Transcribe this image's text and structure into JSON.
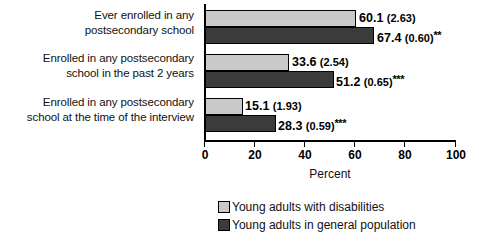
{
  "chart_data": {
    "type": "bar",
    "orientation": "horizontal",
    "title": "",
    "xlabel": "Percent",
    "ylabel": "",
    "xlim": [
      0,
      100
    ],
    "xticks": [
      0,
      20,
      40,
      60,
      80,
      100
    ],
    "grid": false,
    "legend_position": "bottom-center",
    "categories": [
      "Ever enrolled in any postsecondary school",
      "Enrolled in any postsecondary school in the past 2 years",
      "Enrolled in any postsecondary school at the time of the interview"
    ],
    "category_lines": [
      [
        "Ever enrolled in any",
        "postsecondary school"
      ],
      [
        "Enrolled in any postsecondary",
        "school in the past 2 years"
      ],
      [
        "Enrolled in any postsecondary",
        "school at the time of the interview"
      ]
    ],
    "series": [
      {
        "name": "Young adults with disabilities",
        "color": "#c9c9c9",
        "values": [
          60.1,
          33.6,
          15.1
        ],
        "standard_errors": [
          2.63,
          1.93,
          2.54
        ],
        "labels": [
          "60.1 (2.63)",
          "33.6 (2.54)",
          "15.1 (1.93)"
        ],
        "label_value": [
          "60.1",
          "33.6",
          "15.1"
        ],
        "label_se": [
          "(2.63)",
          "(2.54)",
          "(1.93)"
        ],
        "label_stars": [
          "",
          "",
          ""
        ]
      },
      {
        "name": "Young adults in general population",
        "color": "#3b3b3b",
        "values": [
          67.4,
          51.2,
          28.3
        ],
        "standard_errors": [
          0.6,
          0.65,
          0.59
        ],
        "labels": [
          "67.4 (0.60)**",
          "51.2 (0.65)***",
          "28.3 (0.59)***"
        ],
        "label_value": [
          "67.4",
          "51.2",
          "28.3"
        ],
        "label_se": [
          "(0.60)",
          "(0.65)",
          "(0.59)"
        ],
        "label_stars": [
          "**",
          "***",
          "***"
        ]
      }
    ]
  },
  "axis": {
    "tick_labels": [
      "0",
      "20",
      "40",
      "60",
      "80",
      "100"
    ],
    "x_title": "Percent"
  },
  "legend": {
    "items": [
      {
        "label": "Young adults with disabilities",
        "swatch": "light"
      },
      {
        "label": "Young adults in general population",
        "swatch": "dark"
      }
    ]
  }
}
